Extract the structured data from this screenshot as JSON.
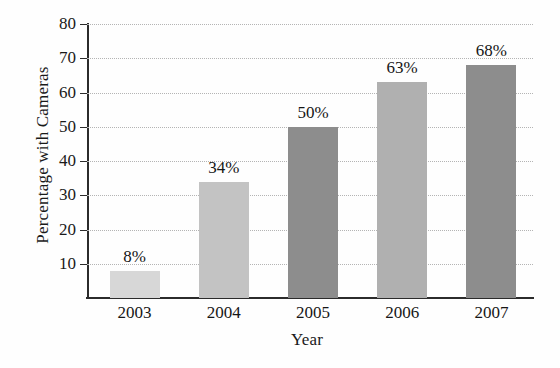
{
  "chart_data": {
    "type": "bar",
    "title": "",
    "xlabel": "Year",
    "ylabel": "Percentage with Cameras",
    "categories": [
      "2003",
      "2004",
      "2005",
      "2006",
      "2007"
    ],
    "values": [
      8,
      34,
      50,
      63,
      68
    ],
    "value_labels": [
      "8%",
      "34%",
      "50%",
      "63%",
      "68%"
    ],
    "bar_colors": [
      "#d7d7d7",
      "#c3c3c3",
      "#8d8d8d",
      "#b0b0b0",
      "#8d8d8d"
    ],
    "ylim": [
      0,
      80
    ],
    "yticks": [
      10,
      20,
      30,
      40,
      50,
      60,
      70,
      80
    ],
    "ytick_labels": [
      "10",
      "20",
      "30",
      "40",
      "50",
      "60",
      "70",
      "80"
    ],
    "grid": true,
    "grid_style": "dotted",
    "grid_color": "#b4b4b4",
    "legend": "none",
    "axis_color": "#2b2b2b",
    "background": "#ffffff"
  }
}
